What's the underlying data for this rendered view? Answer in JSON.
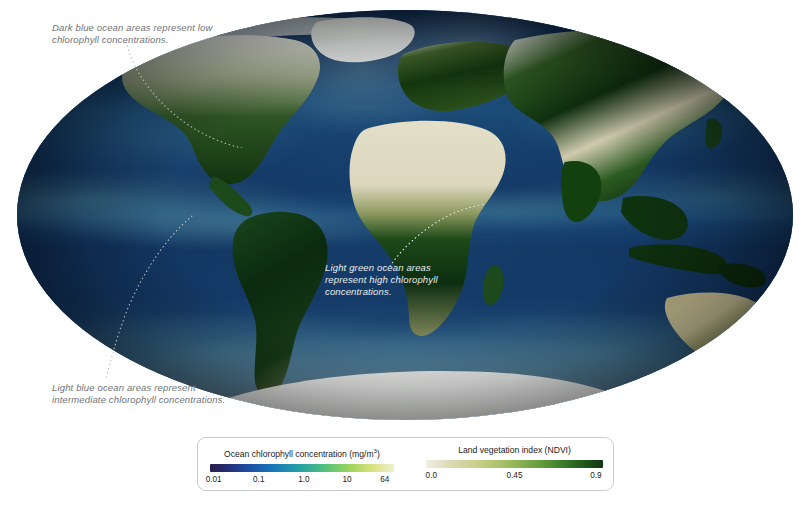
{
  "figure": {
    "type": "map-visualization",
    "projection": "elliptical global (Mollweide-like)",
    "annotations": [
      {
        "id": "low-chlorophyll",
        "text_line1": "Dark blue ocean areas represent low",
        "text_line2": "chlorophyll concentrations.",
        "style": "dark"
      },
      {
        "id": "high-chlorophyll",
        "text_line1": "Light green ocean areas",
        "text_line2": "represent high chlorophyll",
        "text_line3": "concentrations.",
        "style": "light"
      },
      {
        "id": "intermediate-chlorophyll",
        "text_line1": "Light blue ocean areas represent",
        "text_line2": "intermediate chlorophyll concentrations.",
        "style": "dark"
      }
    ]
  },
  "legend": {
    "ocean": {
      "title_main": "Ocean chlorophyll concentration (mg/m",
      "title_sup": "3",
      "title_tail": ")",
      "ticks": [
        "0.01",
        "0.1",
        "1.0",
        "10",
        "64"
      ],
      "tick_positions": [
        2,
        26.5,
        51,
        74.5,
        95
      ],
      "gradient_low_color": "#2b1f4e",
      "gradient_high_color": "#eef0d0"
    },
    "land": {
      "title": "Land vegetation index (NDVI)",
      "ticks": [
        "0.0",
        "0.45",
        "0.9"
      ],
      "tick_positions": [
        3,
        50,
        96
      ],
      "gradient_low_color": "#efeee2",
      "gradient_high_color": "#10340f"
    }
  },
  "chart_data": {
    "type": "heatmap",
    "colorbars": [
      {
        "name": "Ocean chlorophyll concentration (mg/m3)",
        "scale": "log",
        "ticks": [
          0.01,
          0.1,
          1.0,
          10,
          64
        ],
        "low_meaning": "dark blue = low chlorophyll",
        "mid_meaning": "light blue = intermediate chlorophyll",
        "high_meaning": "light green = high chlorophyll"
      },
      {
        "name": "Land vegetation index (NDVI)",
        "scale": "linear",
        "ticks": [
          0.0,
          0.45,
          0.9
        ],
        "low_meaning": "bare / desert",
        "high_meaning": "dense vegetation"
      }
    ],
    "legend_position": "bottom-center",
    "grid": false
  }
}
